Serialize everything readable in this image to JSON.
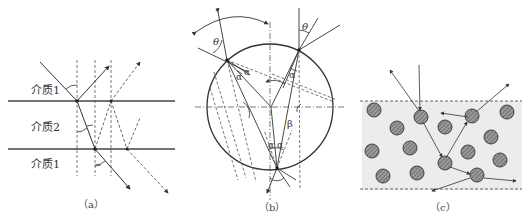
{
  "figure": {
    "panels": [
      {
        "id": "a",
        "caption": "（a）",
        "description": "Light refraction/reflection through layered media",
        "labels": {
          "medium_top": "介质1",
          "medium_middle": "介质2",
          "medium_bottom": "介质1"
        }
      },
      {
        "id": "b",
        "caption": "（b）",
        "description": "Light path inside a spherical droplet",
        "labels": {
          "theta_left": "θ",
          "theta_right": "θ",
          "alpha_left_1": "α",
          "alpha_left_2": "α",
          "alpha_right": "α",
          "alpha_bottom_1": "α",
          "alpha_bottom_2": "α",
          "beta": "β"
        }
      },
      {
        "id": "c",
        "caption": "（c）",
        "description": "Multiple scattering among particles in a medium layer"
      }
    ],
    "colors": {
      "line": "#333333",
      "dashed": "#555555",
      "particle_fill": "#8a8a8a",
      "particle_stroke": "#333333",
      "medium_fill": "#ececec"
    }
  }
}
